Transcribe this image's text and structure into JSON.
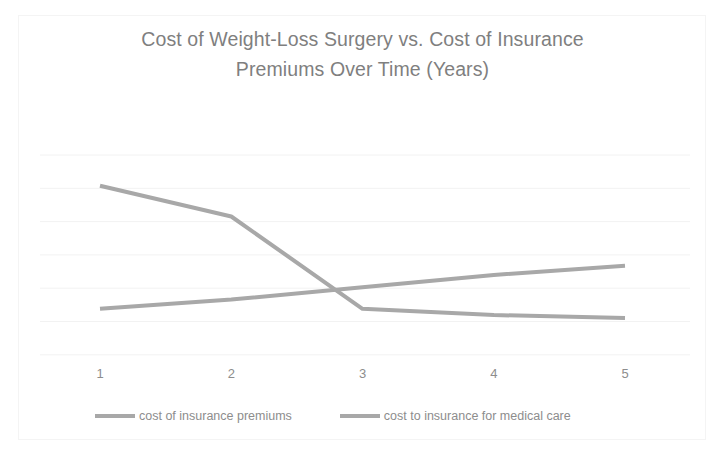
{
  "chart_data": {
    "type": "line",
    "title": "Cost of Weight-Loss Surgery vs. Cost of Insurance Premiums Over Time (Years)",
    "title_line1": "Cost of Weight-Loss Surgery vs. Cost of Insurance",
    "title_line2": "Premiums Over Time (Years)",
    "xlabel": "",
    "ylabel": "",
    "x": [
      1,
      2,
      3,
      4,
      5
    ],
    "categories": [
      "1",
      "2",
      "3",
      "4",
      "5"
    ],
    "xtick_labels": [
      "1",
      "2",
      "3",
      "4",
      "5"
    ],
    "ytick_labels": [],
    "xlim": [
      1,
      5
    ],
    "ylim": [
      30,
      95
    ],
    "grid": "horizontal",
    "legend_position": "bottom",
    "series": [
      {
        "name": "cost of insurance premiums",
        "color": "#a8a8a8",
        "values": [
          45,
          48,
          52,
          56,
          59
        ]
      },
      {
        "name": "cost to insurance for medical care",
        "color": "#a8a8a8",
        "values": [
          85,
          75,
          45,
          43,
          42
        ]
      }
    ],
    "annotations": []
  },
  "legend": {
    "items": [
      {
        "label": "cost of insurance premiums",
        "color": "#a8a8a8"
      },
      {
        "label": "cost to insurance for medical care",
        "color": "#a8a8a8"
      }
    ]
  },
  "colors": {
    "series_line": "#a8a8a8",
    "title_text": "#7f7f7f",
    "tick_text": "#8d8d8d",
    "gridline": "#f2f2f2",
    "frame": "#f4f4f4",
    "background": "#ffffff"
  }
}
